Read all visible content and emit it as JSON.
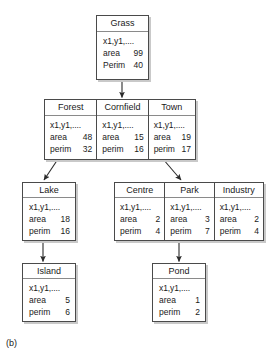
{
  "figure": {
    "label": "(b)",
    "colors": {
      "box_border": "#4a4a4a",
      "header_rule": "#8a8a8a",
      "shadow": "#c9c9c9",
      "background": "#ffffff",
      "text": "#1a1a1a"
    }
  },
  "nodes": {
    "grass": {
      "title": "Grass",
      "coords": "x1,y1,....",
      "area_key": "area",
      "area_value": "99",
      "perim_key": "Perim",
      "perim_value": "40"
    },
    "forest": {
      "title": "Forest",
      "coords": "x1,y1,....",
      "area_key": "area",
      "area_value": "48",
      "perim_key": "perim",
      "perim_value": "32"
    },
    "cornfield": {
      "title": "Cornfield",
      "coords": "x1,y1,....",
      "area_key": "area",
      "area_value": "15",
      "perim_key": "perim",
      "perim_value": "16"
    },
    "town": {
      "title": "Town",
      "coords": "x1,y1,....",
      "area_key": "area",
      "area_value": "19",
      "perim_key": "perim",
      "perim_value": "17"
    },
    "lake": {
      "title": "Lake",
      "coords": "x1,y1,....",
      "area_key": "area",
      "area_value": "18",
      "perim_key": "perim",
      "perim_value": "16"
    },
    "centre": {
      "title": "Centre",
      "coords": "x1,y1,....",
      "area_key": "area",
      "area_value": "2",
      "perim_key": "perim",
      "perim_value": "4"
    },
    "park": {
      "title": "Park",
      "coords": "x1,y1,....",
      "area_key": "area",
      "area_value": "3",
      "perim_key": "perim",
      "perim_value": "7"
    },
    "industry": {
      "title": "Industry",
      "coords": "x1,y1,....",
      "area_key": "area",
      "area_value": "2",
      "perim_key": "perim",
      "perim_value": "4"
    },
    "island": {
      "title": "Island",
      "coords": "x1,y1,....",
      "area_key": "area",
      "area_value": "5",
      "perim_key": "perim",
      "perim_value": "6"
    },
    "pond": {
      "title": "Pond",
      "coords": "x1,y1,....",
      "area_key": "area",
      "area_value": "1",
      "perim_key": "perim",
      "perim_value": "2"
    }
  },
  "edges": [
    {
      "name": "grass-to-row2",
      "from": "grass",
      "to": "cornfield",
      "style": "vertical"
    },
    {
      "name": "forest-to-lake",
      "from": "forest",
      "to": "lake",
      "style": "diagonal-left"
    },
    {
      "name": "town-to-row3",
      "from": "town",
      "to": "park",
      "style": "diagonal-right"
    },
    {
      "name": "lake-to-island",
      "from": "lake",
      "to": "island",
      "style": "vertical"
    },
    {
      "name": "park-to-pond",
      "from": "park",
      "to": "pond",
      "style": "vertical"
    }
  ]
}
